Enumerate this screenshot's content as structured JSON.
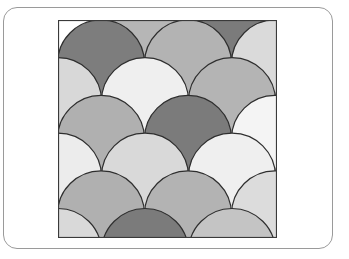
{
  "figure": {
    "type": "scale-pattern",
    "frame": {
      "x": 0,
      "y": 0,
      "width": 219,
      "height": 218,
      "stroke": "#3a3a3a"
    },
    "scale_radius": 43.5,
    "row_spacing": 37.7,
    "stroke_color": "#2e2e2e",
    "rows": [
      {
        "top": -37.7,
        "xs": [
          0,
          87,
          174,
          261
        ],
        "colors": [
          "#ffffff",
          "#b6b6b6",
          "#7b7b7b",
          "#ffffff"
        ]
      },
      {
        "top": 0,
        "xs": [
          43,
          130,
          217
        ],
        "colors": [
          "#7d7d7d",
          "#b3b3b3",
          "#dadada"
        ]
      },
      {
        "top": 37.7,
        "xs": [
          0,
          87,
          174,
          261
        ],
        "colors": [
          "#d8d8d8",
          "#efefef",
          "#b4b4b4",
          "#d8d8d8"
        ]
      },
      {
        "top": 75.4,
        "xs": [
          43,
          130,
          217
        ],
        "colors": [
          "#b0b0b0",
          "#7b7b7b",
          "#f4f4f4"
        ]
      },
      {
        "top": 113.1,
        "xs": [
          0,
          87,
          174,
          261
        ],
        "colors": [
          "#ececec",
          "#d9d9d9",
          "#efefef",
          "#ececec"
        ]
      },
      {
        "top": 150.8,
        "xs": [
          43,
          130,
          217
        ],
        "colors": [
          "#b0b0b0",
          "#b3b3b3",
          "#dcdcdc"
        ]
      },
      {
        "top": 188.5,
        "xs": [
          0,
          87,
          174,
          261
        ],
        "colors": [
          "#d9d9d9",
          "#7b7b7b",
          "#c4c4c4",
          "#d9d9d9"
        ]
      }
    ]
  }
}
